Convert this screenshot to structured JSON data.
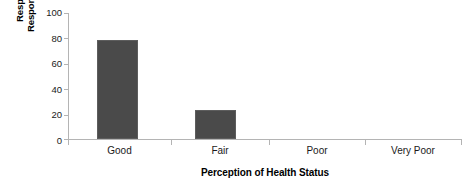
{
  "chart_data": {
    "type": "bar",
    "title": "",
    "subtitle": "",
    "categories": [
      "Good",
      "Fair",
      "Poor",
      "Very Poor"
    ],
    "values": [
      78,
      23,
      0,
      0
    ],
    "xlabel": "Perception of Health Status",
    "ylabel_lines": [
      "Response of",
      "Respondents (%)"
    ],
    "ylabel": "Response of Respondents (%)",
    "ylim": [
      0,
      100
    ],
    "yticks": [
      0,
      20,
      40,
      60,
      80,
      100
    ],
    "ytick_labels": [
      "0",
      "20",
      "40",
      "60",
      "80",
      "100"
    ],
    "grid": false,
    "legend": false,
    "legend_position": "none",
    "bar_color": "#4a4a4a",
    "axis_color": "#b4b4b4",
    "text_color": "#1a1a1a",
    "background": "#ffffff"
  },
  "axes": {
    "y_title_line1": "Response of",
    "y_title_line2": "Respondents (%)",
    "x_title": "Perception of Health Status"
  },
  "ticks": {
    "y": [
      {
        "label": "100",
        "value": 100
      },
      {
        "label": "80",
        "value": 80
      },
      {
        "label": "60",
        "value": 60
      },
      {
        "label": "40",
        "value": 40
      },
      {
        "label": "20",
        "value": 20
      },
      {
        "label": "0",
        "value": 0
      }
    ]
  },
  "bars": [
    {
      "label": "Good",
      "value": 78
    },
    {
      "label": "Fair",
      "value": 23
    },
    {
      "label": "Poor",
      "value": 0
    },
    {
      "label": "Very Poor",
      "value": 0
    }
  ]
}
